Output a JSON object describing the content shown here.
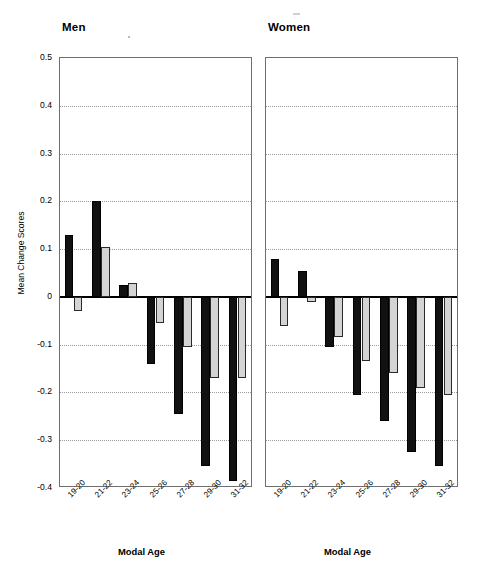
{
  "chart_data": {
    "type": "bar",
    "title": "",
    "panels": [
      {
        "name": "men",
        "label": "Men",
        "xlabel": "Modal Age",
        "categories": [
          "19-20",
          "21-22",
          "23-24",
          "25-26",
          "27-28",
          "29-30",
          "31-32"
        ],
        "series": [
          {
            "name": "Unadjusted",
            "color": "#111111",
            "values": [
              0.13,
              0.2,
              0.025,
              -0.14,
              -0.245,
              -0.355,
              -0.385
            ]
          },
          {
            "name": "Adjusted",
            "color": "#d4d4d4",
            "values": [
              -0.03,
              0.105,
              0.03,
              -0.055,
              -0.105,
              -0.17,
              -0.17
            ]
          }
        ]
      },
      {
        "name": "women",
        "label": "Women",
        "xlabel": "Modal Age",
        "categories": [
          "19-20",
          "21-22",
          "23-24",
          "25-26",
          "27-28",
          "29-30",
          "31-32"
        ],
        "series": [
          {
            "name": "Unadjusted",
            "color": "#111111",
            "values": [
              0.08,
              0.055,
              -0.105,
              -0.205,
              -0.26,
              -0.325,
              -0.355
            ]
          },
          {
            "name": "Adjusted",
            "color": "#d4d4d4",
            "values": [
              -0.06,
              -0.01,
              -0.085,
              -0.135,
              -0.16,
              -0.19,
              -0.205
            ]
          }
        ]
      }
    ],
    "ylabel": "Mean Change Scores",
    "ylim": [
      -0.4,
      0.5
    ],
    "yticks": [
      0.5,
      0.4,
      0.3,
      0.2,
      0.1,
      0,
      -0.1,
      -0.2,
      -0.3,
      -0.4
    ],
    "ytick_labels": [
      "0.5",
      "0.4",
      "0.3",
      "0.2",
      "0.1",
      "0",
      "-0.1",
      "-0.2",
      "-0.3",
      "-0.4"
    ],
    "gridlines": [
      0.4,
      0.3,
      0.2,
      0.1,
      -0.1,
      -0.2,
      -0.3
    ],
    "grid": true,
    "zero_line": 0,
    "legend": {
      "position": "top-right",
      "entries": [
        {
          "label": "Unadjusted",
          "color": "#111111"
        },
        {
          "label": "Adjusted",
          "color": "#d4d4d4"
        }
      ]
    }
  }
}
